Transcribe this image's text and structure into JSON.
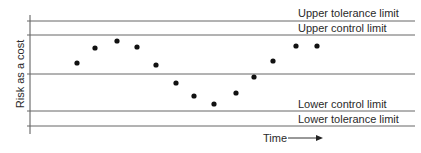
{
  "chart_data": {
    "type": "scatter",
    "title": "",
    "xlabel": "Time",
    "ylabel": "Risk as a cost",
    "grid": false,
    "legend": null,
    "reference_lines": [
      {
        "name": "Upper tolerance limit",
        "y_px": 21
      },
      {
        "name": "Upper control limit",
        "y_px": 35
      },
      {
        "name": "Center line",
        "y_px": 74
      },
      {
        "name": "Lower control limit",
        "y_px": 111
      },
      {
        "name": "Lower tolerance limit",
        "y_px": 126
      }
    ],
    "points_px": [
      {
        "x": 77,
        "y": 63
      },
      {
        "x": 95,
        "y": 48
      },
      {
        "x": 117,
        "y": 41
      },
      {
        "x": 137,
        "y": 47
      },
      {
        "x": 156,
        "y": 65
      },
      {
        "x": 176,
        "y": 83
      },
      {
        "x": 194,
        "y": 96
      },
      {
        "x": 214,
        "y": 104
      },
      {
        "x": 236,
        "y": 93
      },
      {
        "x": 254,
        "y": 77
      },
      {
        "x": 273,
        "y": 61
      },
      {
        "x": 296,
        "y": 46
      },
      {
        "x": 317,
        "y": 46
      }
    ],
    "annotations": [
      "Upper tolerance limit",
      "Upper control limit",
      "Lower control limit",
      "Lower tolerance limit",
      "Time →"
    ]
  },
  "labels": {
    "upper_tolerance": "Upper tolerance limit",
    "upper_control": "Upper control limit",
    "lower_control": "Lower control limit",
    "lower_tolerance": "Lower tolerance limit",
    "y_axis": "Risk as a cost",
    "x_axis": "Time"
  },
  "colors": {
    "line": "#555555",
    "point": "#111111",
    "text": "#2a2a2a"
  }
}
